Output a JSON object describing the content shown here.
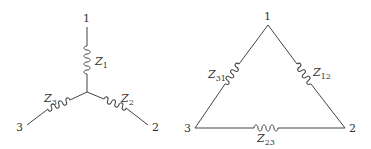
{
  "wye": {
    "nodes": {
      "n1": "1",
      "n2": "2",
      "n3": "3"
    },
    "impedances": {
      "z1": {
        "base": "Z",
        "sub": "1"
      },
      "z2": {
        "base": "Z",
        "sub": "2"
      },
      "z3": {
        "base": "Z",
        "sub": "3"
      }
    }
  },
  "delta": {
    "nodes": {
      "n1": "1",
      "n2": "2",
      "n3": "3"
    },
    "impedances": {
      "z12": {
        "base": "Z",
        "sub": "12"
      },
      "z23": {
        "base": "Z",
        "sub": "23"
      },
      "z31": {
        "base": "Z",
        "sub": "31"
      }
    }
  },
  "colors": {
    "line": "#444444",
    "text": "#333333",
    "background": "#ffffff"
  }
}
